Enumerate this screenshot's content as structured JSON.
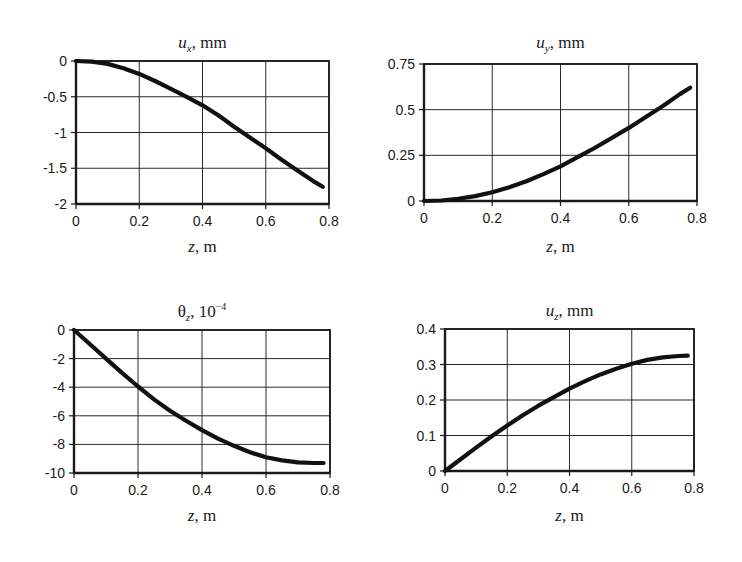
{
  "figure": {
    "panels": [
      {
        "id": "ux",
        "title": {
          "symbol": "u",
          "subscript": "x",
          "superscript": "",
          "unit": ", mm",
          "symbol_italic": true
        },
        "xlabel": {
          "symbol": "z",
          "unit": ", m"
        }
      },
      {
        "id": "uy",
        "title": {
          "symbol": "u",
          "subscript": "y",
          "superscript": "",
          "unit": ", mm",
          "symbol_italic": true
        },
        "xlabel": {
          "symbol": "z",
          "unit": ", m"
        }
      },
      {
        "id": "theta_z",
        "title": {
          "symbol": "θ",
          "subscript": "z",
          "superscript": "−4",
          "unit": ", 10",
          "symbol_italic": false
        },
        "xlabel": {
          "symbol": "z",
          "unit": ", m"
        }
      },
      {
        "id": "uz",
        "title": {
          "symbol": "u",
          "subscript": "z",
          "superscript": "",
          "unit": ", mm",
          "symbol_italic": true
        },
        "xlabel": {
          "symbol": "z",
          "unit": ", m"
        }
      }
    ]
  },
  "chart_data": [
    {
      "type": "line",
      "title": "u_x, mm",
      "xlabel": "z, m",
      "ylabel": "",
      "xlim": [
        0,
        0.8
      ],
      "ylim": [
        -2,
        0
      ],
      "xticks": [
        0,
        0.2,
        0.4,
        0.6,
        0.8
      ],
      "xtick_labels": [
        "0",
        "0.2",
        "0.4",
        "0.6",
        "0.8"
      ],
      "yticks": [
        0,
        -0.5,
        -1,
        -1.5,
        -2
      ],
      "ytick_labels": [
        "0",
        "-0.5",
        "-1",
        "-1.5",
        "-2"
      ],
      "grid": true,
      "legend": null,
      "series": [
        {
          "name": "u_x",
          "x": [
            0,
            0.05,
            0.1,
            0.15,
            0.2,
            0.25,
            0.3,
            0.35,
            0.4,
            0.45,
            0.5,
            0.55,
            0.6,
            0.65,
            0.7,
            0.75,
            0.78
          ],
          "y": [
            0,
            -0.01,
            -0.04,
            -0.1,
            -0.18,
            -0.28,
            -0.39,
            -0.5,
            -0.62,
            -0.76,
            -0.92,
            -1.07,
            -1.22,
            -1.38,
            -1.53,
            -1.68,
            -1.76
          ]
        }
      ]
    },
    {
      "type": "line",
      "title": "u_y, mm",
      "xlabel": "z, m",
      "ylabel": "",
      "xlim": [
        0,
        0.8
      ],
      "ylim": [
        0,
        0.75
      ],
      "xticks": [
        0,
        0.2,
        0.4,
        0.6,
        0.8
      ],
      "xtick_labels": [
        "0",
        "0.2",
        "0.4",
        "0.6",
        "0.8"
      ],
      "yticks": [
        0,
        0.25,
        0.5,
        0.75
      ],
      "ytick_labels": [
        "0",
        "0.25",
        "0.5",
        "0.75"
      ],
      "grid": true,
      "legend": null,
      "series": [
        {
          "name": "u_y",
          "x": [
            0,
            0.05,
            0.1,
            0.15,
            0.2,
            0.25,
            0.3,
            0.35,
            0.4,
            0.45,
            0.5,
            0.55,
            0.6,
            0.65,
            0.7,
            0.75,
            0.78
          ],
          "y": [
            0,
            0.003,
            0.012,
            0.027,
            0.048,
            0.075,
            0.108,
            0.147,
            0.19,
            0.24,
            0.29,
            0.345,
            0.4,
            0.46,
            0.52,
            0.585,
            0.62
          ]
        }
      ]
    },
    {
      "type": "line",
      "title": "θ_z, 10^-4",
      "xlabel": "z, m",
      "ylabel": "",
      "xlim": [
        0,
        0.8
      ],
      "ylim": [
        -10,
        0
      ],
      "xticks": [
        0,
        0.2,
        0.4,
        0.6,
        0.8
      ],
      "xtick_labels": [
        "0",
        "0.2",
        "0.4",
        "0.6",
        "0.8"
      ],
      "yticks": [
        0,
        -2,
        -4,
        -6,
        -8,
        -10
      ],
      "ytick_labels": [
        "0",
        "-2",
        "-4",
        "-6",
        "-8",
        "-10"
      ],
      "grid": true,
      "legend": null,
      "series": [
        {
          "name": "θ_z",
          "x": [
            0,
            0.05,
            0.1,
            0.15,
            0.2,
            0.25,
            0.3,
            0.35,
            0.4,
            0.45,
            0.5,
            0.55,
            0.6,
            0.65,
            0.7,
            0.75,
            0.78
          ],
          "y": [
            0,
            -1.0,
            -2.0,
            -3.0,
            -3.95,
            -4.85,
            -5.65,
            -6.35,
            -7.0,
            -7.6,
            -8.1,
            -8.55,
            -8.9,
            -9.12,
            -9.25,
            -9.3,
            -9.3
          ]
        }
      ]
    },
    {
      "type": "line",
      "title": "u_z, mm",
      "xlabel": "z, m",
      "ylabel": "",
      "xlim": [
        0,
        0.8
      ],
      "ylim": [
        0,
        0.4
      ],
      "xticks": [
        0,
        0.2,
        0.4,
        0.6,
        0.8
      ],
      "xtick_labels": [
        "0",
        "0.2",
        "0.4",
        "0.6",
        "0.8"
      ],
      "yticks": [
        0,
        0.1,
        0.2,
        0.3,
        0.4
      ],
      "ytick_labels": [
        "0",
        "0.1",
        "0.2",
        "0.3",
        "0.4"
      ],
      "grid": true,
      "legend": null,
      "series": [
        {
          "name": "u_z",
          "x": [
            0,
            0.05,
            0.1,
            0.15,
            0.2,
            0.25,
            0.3,
            0.35,
            0.4,
            0.45,
            0.5,
            0.55,
            0.6,
            0.65,
            0.7,
            0.75,
            0.78
          ],
          "y": [
            0,
            0.033,
            0.066,
            0.098,
            0.128,
            0.157,
            0.184,
            0.208,
            0.232,
            0.253,
            0.272,
            0.288,
            0.302,
            0.313,
            0.32,
            0.324,
            0.325
          ]
        }
      ]
    }
  ]
}
